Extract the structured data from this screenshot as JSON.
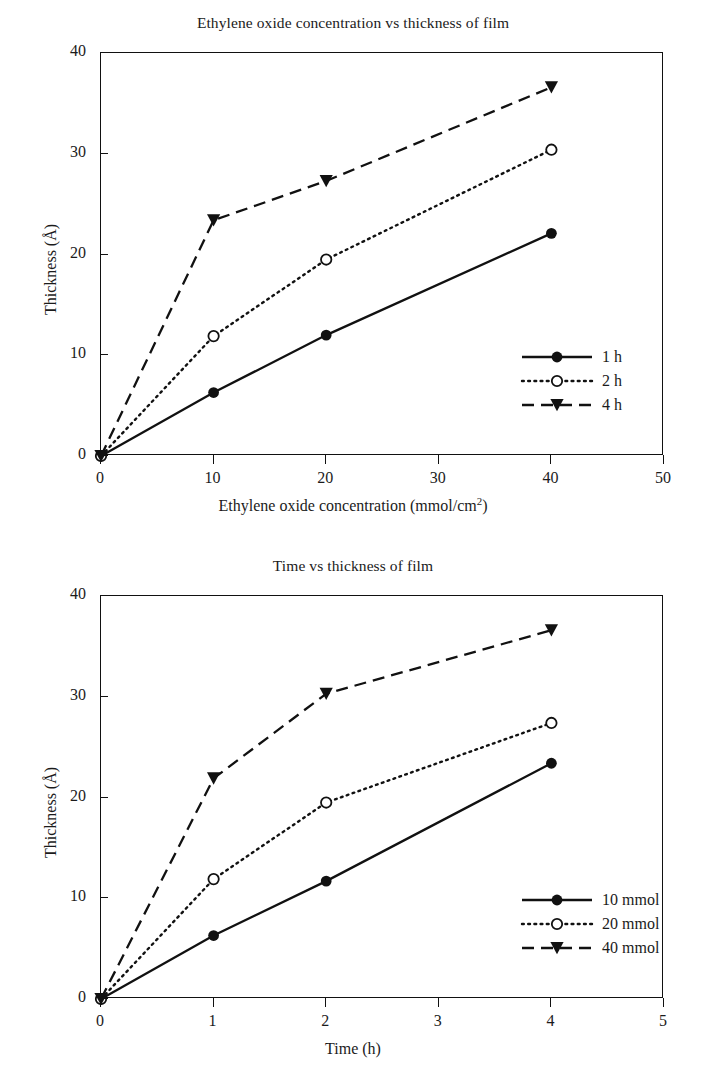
{
  "chart_data": [
    {
      "type": "line",
      "id": "ethylene-oxide-concentration-vs-thickness",
      "title": "Ethylene oxide concentration vs thickness of film",
      "xlabel_prefix": "Ethylene oxide concentration (mmol/cm",
      "xlabel_sup": "2",
      "xlabel_suffix": ")",
      "xlabel": "Ethylene oxide concentration (mmol/cm2)",
      "ylabel_prefix": "Thickness (",
      "ylabel_unit": "Å",
      "ylabel_suffix": ")",
      "ylabel": "Thickness (Å)",
      "xlim": [
        0,
        50
      ],
      "ylim": [
        0,
        40
      ],
      "xticks": [
        0,
        10,
        20,
        30,
        40,
        50
      ],
      "xtick_labels": [
        "0",
        "10",
        "20",
        "30",
        "40",
        "50"
      ],
      "yticks": [
        0,
        10,
        20,
        30,
        40
      ],
      "ytick_labels": [
        "0",
        "10",
        "20",
        "30",
        "40"
      ],
      "grid": false,
      "legend_position": "lower-right-inside",
      "x": [
        0,
        10,
        20,
        40
      ],
      "series": [
        {
          "name": "1 h",
          "values": [
            0,
            6.3,
            12.0,
            22.1
          ],
          "line": "solid",
          "marker": "filled-circle"
        },
        {
          "name": "2 h",
          "values": [
            0,
            11.9,
            19.5,
            30.4
          ],
          "line": "dotted",
          "marker": "open-circle"
        },
        {
          "name": "4 h",
          "values": [
            0,
            23.4,
            27.3,
            36.6
          ],
          "line": "dashed",
          "marker": "filled-triangle-down"
        }
      ]
    },
    {
      "type": "line",
      "id": "time-vs-thickness",
      "title": "Time vs thickness of film",
      "xlabel": "Time (h)",
      "ylabel_prefix": "Thickness (",
      "ylabel_unit": "Å",
      "ylabel_suffix": ")",
      "ylabel": "Thickness (Å)",
      "xlim": [
        0,
        5
      ],
      "ylim": [
        0,
        40
      ],
      "xticks": [
        0,
        1,
        2,
        3,
        4,
        5
      ],
      "xtick_labels": [
        "0",
        "1",
        "2",
        "3",
        "4",
        "5"
      ],
      "yticks": [
        0,
        10,
        20,
        30,
        40
      ],
      "ytick_labels": [
        "0",
        "10",
        "20",
        "30",
        "40"
      ],
      "grid": false,
      "legend_position": "lower-right-inside",
      "x": [
        0,
        1,
        2,
        4
      ],
      "series": [
        {
          "name": "10 mmol",
          "values": [
            0,
            6.3,
            11.7,
            23.4
          ],
          "line": "solid",
          "marker": "filled-circle"
        },
        {
          "name": "20 mmol",
          "values": [
            0,
            11.9,
            19.5,
            27.4
          ],
          "line": "dotted",
          "marker": "open-circle"
        },
        {
          "name": "40 mmol",
          "values": [
            0,
            21.9,
            30.3,
            36.6
          ],
          "line": "dashed",
          "marker": "filled-triangle-down"
        }
      ]
    }
  ],
  "style": {
    "ink": "#111111",
    "text": "#1b1b1b",
    "background": "#ffffff"
  }
}
